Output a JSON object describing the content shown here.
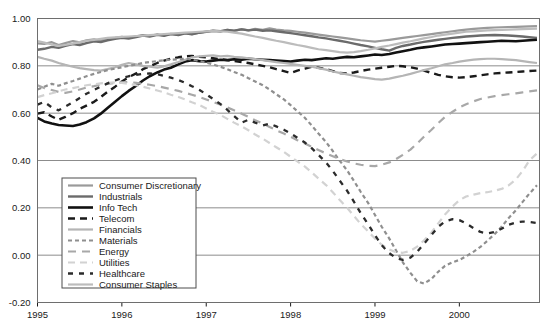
{
  "chart_data": {
    "type": "line",
    "title": "",
    "xlabel": "",
    "ylabel": "",
    "grid": true,
    "legend_position": "inside-bottom-left",
    "xlim": [
      1995.0,
      2000.95
    ],
    "ylim": [
      -0.2,
      1.0
    ],
    "yticks": [
      "1.00",
      "0.80",
      "0.60",
      "0.40",
      "0.20",
      "0.00",
      "-0.20"
    ],
    "ytick_values": [
      1.0,
      0.8,
      0.6,
      0.4,
      0.2,
      0.0,
      -0.2
    ],
    "xticks": [
      "1995",
      "1996",
      "1997",
      "1998",
      "1999",
      "2000"
    ],
    "xtick_values": [
      1995,
      1996,
      1997,
      1998,
      1999,
      2000
    ],
    "x": [
      1995.0,
      1995.08,
      1995.17,
      1995.25,
      1995.33,
      1995.42,
      1995.5,
      1995.58,
      1995.67,
      1995.75,
      1995.83,
      1995.92,
      1996.0,
      1996.08,
      1996.17,
      1996.25,
      1996.33,
      1996.42,
      1996.5,
      1996.58,
      1996.67,
      1996.75,
      1996.83,
      1996.92,
      1997.0,
      1997.08,
      1997.17,
      1997.25,
      1997.33,
      1997.42,
      1997.5,
      1997.58,
      1997.67,
      1997.75,
      1997.83,
      1997.92,
      1998.0,
      1998.08,
      1998.17,
      1998.25,
      1998.33,
      1998.42,
      1998.5,
      1998.58,
      1998.67,
      1998.75,
      1998.83,
      1998.92,
      1999.0,
      1999.08,
      1999.17,
      1999.25,
      1999.33,
      1999.42,
      1999.5,
      1999.58,
      1999.67,
      1999.75,
      1999.83,
      1999.92,
      2000.0,
      2000.08,
      2000.17,
      2000.25,
      2000.33,
      2000.42,
      2000.5,
      2000.58,
      2000.67,
      2000.75,
      2000.83,
      2000.92
    ],
    "series": [
      {
        "name": "Consumer Discretionary",
        "color": "#9a9a9a",
        "width": 2.2,
        "dash": "none",
        "values": [
          0.895,
          0.893,
          0.9,
          0.888,
          0.896,
          0.905,
          0.899,
          0.908,
          0.912,
          0.906,
          0.915,
          0.918,
          0.922,
          0.918,
          0.925,
          0.93,
          0.926,
          0.933,
          0.928,
          0.935,
          0.932,
          0.938,
          0.934,
          0.94,
          0.944,
          0.948,
          0.945,
          0.952,
          0.948,
          0.955,
          0.95,
          0.956,
          0.952,
          0.958,
          0.953,
          0.95,
          0.948,
          0.944,
          0.94,
          0.936,
          0.932,
          0.928,
          0.924,
          0.92,
          0.916,
          0.912,
          0.908,
          0.905,
          0.902,
          0.906,
          0.91,
          0.914,
          0.918,
          0.922,
          0.926,
          0.93,
          0.934,
          0.938,
          0.942,
          0.946,
          0.95,
          0.953,
          0.956,
          0.958,
          0.96,
          0.962,
          0.963,
          0.964,
          0.965,
          0.966,
          0.967,
          0.968
        ]
      },
      {
        "name": "Industrials",
        "color": "#6b6b6b",
        "width": 2.4,
        "dash": "none",
        "values": [
          0.868,
          0.872,
          0.88,
          0.876,
          0.884,
          0.892,
          0.888,
          0.896,
          0.904,
          0.9,
          0.908,
          0.914,
          0.918,
          0.915,
          0.922,
          0.928,
          0.924,
          0.931,
          0.927,
          0.934,
          0.93,
          0.937,
          0.933,
          0.94,
          0.944,
          0.948,
          0.946,
          0.952,
          0.949,
          0.954,
          0.95,
          0.953,
          0.948,
          0.95,
          0.946,
          0.942,
          0.938,
          0.934,
          0.929,
          0.925,
          0.92,
          0.916,
          0.911,
          0.906,
          0.9,
          0.894,
          0.888,
          0.882,
          0.876,
          0.87,
          0.864,
          0.876,
          0.884,
          0.89,
          0.896,
          0.901,
          0.906,
          0.91,
          0.914,
          0.918,
          0.921,
          0.924,
          0.926,
          0.928,
          0.929,
          0.93,
          0.929,
          0.928,
          0.926,
          0.924,
          0.921,
          0.918
        ]
      },
      {
        "name": "Info Tech",
        "color": "#111111",
        "width": 2.6,
        "dash": "none",
        "values": [
          0.58,
          0.565,
          0.556,
          0.55,
          0.548,
          0.546,
          0.552,
          0.562,
          0.578,
          0.598,
          0.622,
          0.648,
          0.672,
          0.694,
          0.716,
          0.738,
          0.756,
          0.772,
          0.784,
          0.792,
          0.806,
          0.818,
          0.824,
          0.82,
          0.818,
          0.822,
          0.826,
          0.824,
          0.828,
          0.826,
          0.83,
          0.828,
          0.826,
          0.824,
          0.822,
          0.82,
          0.818,
          0.822,
          0.826,
          0.824,
          0.828,
          0.832,
          0.83,
          0.834,
          0.838,
          0.836,
          0.84,
          0.844,
          0.848,
          0.846,
          0.85,
          0.856,
          0.862,
          0.868,
          0.874,
          0.878,
          0.882,
          0.886,
          0.89,
          0.892,
          0.894,
          0.896,
          0.898,
          0.9,
          0.902,
          0.904,
          0.906,
          0.905,
          0.904,
          0.906,
          0.908,
          0.91
        ]
      },
      {
        "name": "Telecom",
        "color": "#1a1a1a",
        "width": 2.4,
        "dash": "7,5",
        "values": [
          0.598,
          0.604,
          0.586,
          0.572,
          0.584,
          0.6,
          0.618,
          0.632,
          0.648,
          0.668,
          0.69,
          0.712,
          0.734,
          0.752,
          0.768,
          0.786,
          0.798,
          0.812,
          0.822,
          0.83,
          0.836,
          0.84,
          0.842,
          0.838,
          0.836,
          0.832,
          0.828,
          0.824,
          0.82,
          0.816,
          0.812,
          0.806,
          0.8,
          0.794,
          0.786,
          0.778,
          0.77,
          0.78,
          0.788,
          0.796,
          0.792,
          0.786,
          0.778,
          0.77,
          0.768,
          0.772,
          0.778,
          0.784,
          0.788,
          0.792,
          0.796,
          0.8,
          0.798,
          0.794,
          0.788,
          0.78,
          0.77,
          0.762,
          0.756,
          0.752,
          0.75,
          0.752,
          0.756,
          0.76,
          0.764,
          0.768,
          0.77,
          0.772,
          0.774,
          0.776,
          0.778,
          0.78
        ]
      },
      {
        "name": "Financials",
        "color": "#b5b5b5",
        "width": 2.2,
        "dash": "none",
        "values": [
          0.838,
          0.83,
          0.822,
          0.812,
          0.804,
          0.796,
          0.79,
          0.786,
          0.782,
          0.78,
          0.786,
          0.794,
          0.804,
          0.812,
          0.806,
          0.8,
          0.796,
          0.792,
          0.798,
          0.806,
          0.816,
          0.826,
          0.836,
          0.84,
          0.842,
          0.844,
          0.84,
          0.842,
          0.838,
          0.836,
          0.832,
          0.828,
          0.824,
          0.82,
          0.816,
          0.812,
          0.808,
          0.804,
          0.8,
          0.796,
          0.79,
          0.784,
          0.776,
          0.77,
          0.764,
          0.758,
          0.752,
          0.748,
          0.744,
          0.742,
          0.746,
          0.752,
          0.758,
          0.766,
          0.774,
          0.782,
          0.79,
          0.798,
          0.806,
          0.812,
          0.818,
          0.822,
          0.826,
          0.828,
          0.83,
          0.83,
          0.828,
          0.826,
          0.824,
          0.82,
          0.816,
          0.812
        ]
      },
      {
        "name": "Materials",
        "color": "#8f8f8f",
        "width": 2.2,
        "dash": "4,3",
        "values": [
          0.7,
          0.712,
          0.724,
          0.716,
          0.726,
          0.736,
          0.746,
          0.756,
          0.766,
          0.774,
          0.782,
          0.788,
          0.794,
          0.8,
          0.806,
          0.812,
          0.816,
          0.82,
          0.824,
          0.826,
          0.828,
          0.83,
          0.826,
          0.82,
          0.814,
          0.806,
          0.796,
          0.786,
          0.774,
          0.762,
          0.748,
          0.734,
          0.718,
          0.7,
          0.68,
          0.658,
          0.634,
          0.608,
          0.58,
          0.548,
          0.514,
          0.478,
          0.44,
          0.4,
          0.358,
          0.314,
          0.268,
          0.22,
          0.17,
          0.12,
          0.07,
          0.02,
          -0.03,
          -0.075,
          -0.11,
          -0.12,
          -0.1,
          -0.07,
          -0.045,
          -0.03,
          -0.02,
          -0.005,
          0.015,
          0.035,
          0.06,
          0.09,
          0.12,
          0.155,
          0.19,
          0.225,
          0.26,
          0.295
        ]
      },
      {
        "name": "Energy",
        "color": "#a8a8a8",
        "width": 2.2,
        "dash": "8,6",
        "values": [
          0.718,
          0.706,
          0.698,
          0.69,
          0.686,
          0.692,
          0.7,
          0.708,
          0.714,
          0.72,
          0.724,
          0.728,
          0.73,
          0.732,
          0.728,
          0.724,
          0.72,
          0.714,
          0.708,
          0.702,
          0.694,
          0.686,
          0.678,
          0.668,
          0.658,
          0.648,
          0.636,
          0.624,
          0.612,
          0.598,
          0.584,
          0.57,
          0.556,
          0.542,
          0.528,
          0.514,
          0.5,
          0.486,
          0.472,
          0.458,
          0.444,
          0.43,
          0.418,
          0.406,
          0.396,
          0.388,
          0.382,
          0.378,
          0.376,
          0.382,
          0.392,
          0.406,
          0.424,
          0.446,
          0.472,
          0.5,
          0.53,
          0.558,
          0.584,
          0.606,
          0.624,
          0.638,
          0.65,
          0.66,
          0.666,
          0.672,
          0.676,
          0.68,
          0.684,
          0.688,
          0.692,
          0.696
        ]
      },
      {
        "name": "Utilities",
        "color": "#d2d2d2",
        "width": 2.2,
        "dash": "7,5",
        "values": [
          0.668,
          0.676,
          0.684,
          0.692,
          0.7,
          0.706,
          0.712,
          0.718,
          0.722,
          0.726,
          0.728,
          0.73,
          0.728,
          0.724,
          0.718,
          0.712,
          0.704,
          0.696,
          0.688,
          0.678,
          0.668,
          0.658,
          0.646,
          0.634,
          0.62,
          0.606,
          0.592,
          0.576,
          0.56,
          0.544,
          0.528,
          0.51,
          0.492,
          0.474,
          0.456,
          0.436,
          0.416,
          0.396,
          0.374,
          0.35,
          0.324,
          0.296,
          0.266,
          0.234,
          0.2,
          0.166,
          0.132,
          0.1,
          0.07,
          0.044,
          0.024,
          0.012,
          0.01,
          0.018,
          0.036,
          0.062,
          0.096,
          0.134,
          0.172,
          0.206,
          0.232,
          0.248,
          0.256,
          0.262,
          0.266,
          0.272,
          0.28,
          0.294,
          0.32,
          0.356,
          0.4,
          0.43
        ]
      },
      {
        "name": "Healthcare",
        "color": "#2b2b2b",
        "width": 2.3,
        "dash": "5,6",
        "values": [
          0.636,
          0.648,
          0.624,
          0.612,
          0.628,
          0.646,
          0.664,
          0.682,
          0.698,
          0.712,
          0.726,
          0.738,
          0.748,
          0.756,
          0.762,
          0.766,
          0.768,
          0.764,
          0.758,
          0.75,
          0.74,
          0.728,
          0.714,
          0.698,
          0.68,
          0.66,
          0.638,
          0.614,
          0.588,
          0.56,
          0.572,
          0.56,
          0.548,
          0.556,
          0.544,
          0.53,
          0.514,
          0.496,
          0.476,
          0.452,
          0.424,
          0.392,
          0.356,
          0.316,
          0.272,
          0.226,
          0.178,
          0.13,
          0.084,
          0.042,
          0.008,
          -0.012,
          -0.02,
          -0.01,
          0.014,
          0.048,
          0.086,
          0.12,
          0.142,
          0.152,
          0.148,
          0.134,
          0.114,
          0.098,
          0.092,
          0.098,
          0.112,
          0.128,
          0.138,
          0.142,
          0.14,
          0.136
        ]
      },
      {
        "name": "Consumer Staples",
        "color": "#bcbcbc",
        "width": 2.2,
        "dash": "none",
        "values": [
          0.905,
          0.898,
          0.89,
          0.884,
          0.888,
          0.894,
          0.9,
          0.906,
          0.91,
          0.914,
          0.918,
          0.92,
          0.922,
          0.924,
          0.926,
          0.928,
          0.93,
          0.932,
          0.934,
          0.936,
          0.938,
          0.94,
          0.942,
          0.944,
          0.946,
          0.948,
          0.946,
          0.944,
          0.94,
          0.936,
          0.93,
          0.924,
          0.918,
          0.912,
          0.906,
          0.9,
          0.894,
          0.888,
          0.882,
          0.876,
          0.87,
          0.866,
          0.862,
          0.858,
          0.856,
          0.858,
          0.862,
          0.868,
          0.874,
          0.88,
          0.886,
          0.892,
          0.898,
          0.904,
          0.91,
          0.916,
          0.922,
          0.928,
          0.932,
          0.936,
          0.94,
          0.944,
          0.946,
          0.948,
          0.95,
          0.951,
          0.952,
          0.953,
          0.954,
          0.955,
          0.956,
          0.957
        ]
      }
    ]
  },
  "legend": {
    "items": [
      {
        "label": "Consumer Discretionary"
      },
      {
        "label": "Industrials"
      },
      {
        "label": "Info Tech"
      },
      {
        "label": "Telecom"
      },
      {
        "label": "Financials"
      },
      {
        "label": "Materials"
      },
      {
        "label": "Energy"
      },
      {
        "label": "Utilities"
      },
      {
        "label": "Healthcare"
      },
      {
        "label": "Consumer Staples"
      }
    ]
  }
}
